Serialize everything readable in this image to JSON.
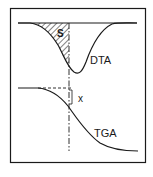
{
  "diagram": {
    "type": "thermal-analysis-schematic",
    "colors": {
      "line": "#1a1a1a",
      "background": "#ffffff"
    },
    "curves": [
      {
        "id": "dta",
        "label": "DTA",
        "description": "endothermic peak below baseline"
      },
      {
        "id": "tga",
        "label": "TGA",
        "description": "mass loss step curve"
      }
    ],
    "annotations": {
      "area_label": "S",
      "mass_loss_label": "x"
    },
    "guides": {
      "vertical_line": "dash-dot",
      "horizontal_line": "dashed"
    }
  }
}
